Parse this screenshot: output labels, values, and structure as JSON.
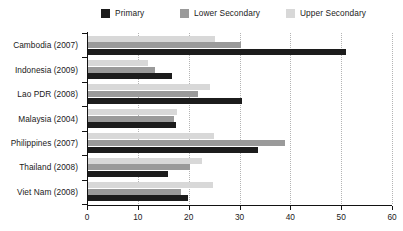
{
  "chart_data": {
    "type": "bar",
    "orientation": "horizontal",
    "title": "",
    "subtitle": "",
    "xlabel": "",
    "ylabel": "",
    "xlim": [
      0,
      60
    ],
    "xticks": [
      0,
      10,
      20,
      30,
      40,
      50,
      60
    ],
    "xtick_labels": [
      "0",
      "10",
      "20",
      "30",
      "40",
      "50",
      "60"
    ],
    "grid": "vertical-dotted",
    "legend_position": "top",
    "categories": [
      "Cambodia (2007)",
      "Indonesia (2009)",
      "Lao PDR (2008)",
      "Malaysia (2004)",
      "Philippines (2007)",
      "Thailand (2008)",
      "Viet Nam (2008)"
    ],
    "series": [
      {
        "name": "Primary",
        "color": "#1c1c1c",
        "values": [
          51.0,
          16.7,
          30.5,
          17.5,
          33.7,
          15.9,
          19.9
        ]
      },
      {
        "name": "Lower Secondary",
        "color": "#9a9a9a",
        "values": [
          30.3,
          13.4,
          21.8,
          17.1,
          39.0,
          20.3,
          18.5
        ]
      },
      {
        "name": "Upper Secondary",
        "color": "#d8d8d8",
        "values": [
          25.2,
          12.0,
          24.2,
          17.7,
          25.0,
          22.6,
          24.8
        ]
      }
    ]
  },
  "legend": {
    "entries": [
      {
        "label": "Primary",
        "color": "#1c1c1c"
      },
      {
        "label": "Lower Secondary",
        "color": "#9a9a9a"
      },
      {
        "label": "Upper Secondary",
        "color": "#d8d8d8"
      }
    ]
  },
  "axis": {
    "x_min": 0,
    "x_max": 60,
    "x_step": 10
  }
}
